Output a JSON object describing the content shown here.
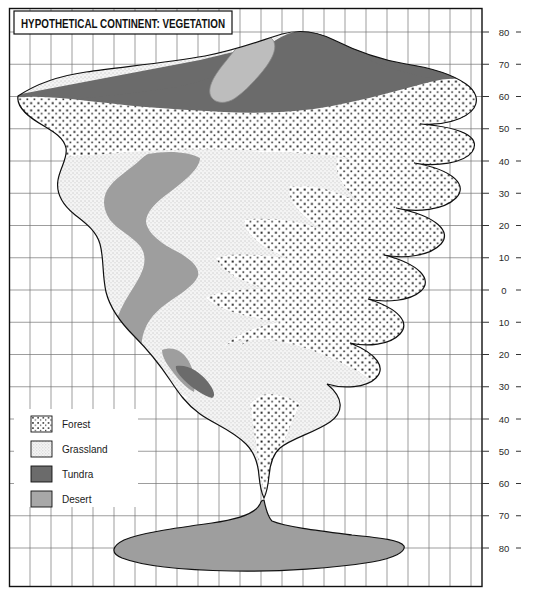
{
  "title": "HYPOTHETICAL CONTINENT: VEGETATION",
  "legend": {
    "items": [
      {
        "label": "Forest",
        "key": "forest",
        "color": "#ffffff",
        "pattern": "coarse-dots"
      },
      {
        "label": "Grassland",
        "key": "grassland",
        "color": "#f2f2f2",
        "pattern": "fine-stipple"
      },
      {
        "label": "Tundra",
        "key": "tundra",
        "color": "#6b6b6b",
        "pattern": "solid"
      },
      {
        "label": "Desert",
        "key": "desert",
        "color": "#a8a8a8",
        "pattern": "solid"
      }
    ]
  },
  "axis": {
    "name": "latitude",
    "unit": "degrees",
    "right_ticks": [
      {
        "label": "80",
        "value": 80
      },
      {
        "label": "70",
        "value": 70
      },
      {
        "label": "60",
        "value": 60
      },
      {
        "label": "50",
        "value": 50
      },
      {
        "label": "40",
        "value": 40
      },
      {
        "label": "30",
        "value": 30
      },
      {
        "label": "20",
        "value": 20
      },
      {
        "label": "10",
        "value": 10
      },
      {
        "label": "0",
        "value": 0
      },
      {
        "label": "10",
        "value": -10
      },
      {
        "label": "20",
        "value": -20
      },
      {
        "label": "30",
        "value": -30
      },
      {
        "label": "40",
        "value": -40
      },
      {
        "label": "50",
        "value": -50
      },
      {
        "label": "60",
        "value": -60
      },
      {
        "label": "70",
        "value": -70
      },
      {
        "label": "80",
        "value": -80
      }
    ]
  },
  "grid": {
    "show": true,
    "meridian_spacing_deg": 10,
    "parallel_spacing_deg": 10,
    "line_color": "#6f6f6f"
  },
  "map": {
    "landmasses": [
      {
        "name": "main-continent",
        "span_lat": [
          72,
          -55
        ],
        "biomes": [
          "tundra",
          "desert",
          "forest",
          "grassland"
        ]
      },
      {
        "name": "southern-continent",
        "span_lat": [
          -61,
          -88
        ],
        "biomes": [
          "desert"
        ]
      }
    ]
  }
}
